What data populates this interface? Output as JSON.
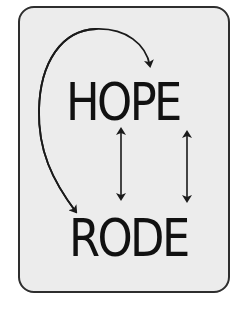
{
  "diagram": {
    "top_word": "HOPE",
    "bottom_word": "RODE",
    "arrows": [
      {
        "name": "curved-arrow",
        "from": "left-edge-of-card",
        "to": "between O and P of HOPE",
        "type": "curved-one-way"
      },
      {
        "name": "curved-arrow",
        "from": "top-curve",
        "to": "R of RODE",
        "type": "curved-one-way"
      },
      {
        "name": "double-arrow",
        "between": [
          "P of HOPE",
          "D of RODE"
        ],
        "type": "bidirectional"
      },
      {
        "name": "double-arrow",
        "between": [
          "E of HOPE",
          "E of RODE"
        ],
        "type": "bidirectional"
      }
    ],
    "colors": {
      "card_background": "#ececec",
      "card_border": "#2e2e2e",
      "text": "#111111",
      "arrow": "#1a1a1a"
    }
  }
}
